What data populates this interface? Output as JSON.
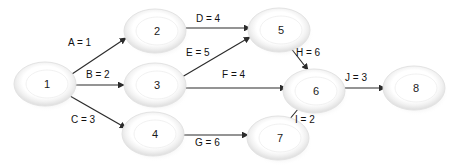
{
  "diagram": {
    "type": "directed-network",
    "background_color": "#ffffff",
    "node_fill_color": "#ffffff",
    "node_ring_color": "#e6e6e6",
    "node_shadow_color": "#cfcfcf",
    "edge_color": "#2b2b2b",
    "label_color": "#111111",
    "nodes": [
      {
        "id": "1",
        "label": "1",
        "cx": 45,
        "cy": 84,
        "rx": 31,
        "ry": 22
      },
      {
        "id": "2",
        "label": "2",
        "cx": 155,
        "cy": 31,
        "rx": 31,
        "ry": 22
      },
      {
        "id": "3",
        "label": "3",
        "cx": 155,
        "cy": 85,
        "rx": 31,
        "ry": 22
      },
      {
        "id": "4",
        "label": "4",
        "cx": 153,
        "cy": 134,
        "rx": 31,
        "ry": 22
      },
      {
        "id": "5",
        "label": "5",
        "cx": 279,
        "cy": 30,
        "rx": 31,
        "ry": 22
      },
      {
        "id": "6",
        "label": "6",
        "cx": 314,
        "cy": 91,
        "rx": 31,
        "ry": 22
      },
      {
        "id": "7",
        "label": "7",
        "cx": 278,
        "cy": 138,
        "rx": 31,
        "ry": 22
      },
      {
        "id": "8",
        "label": "8",
        "cx": 414,
        "cy": 88,
        "rx": 31,
        "ry": 22
      }
    ],
    "edges": [
      {
        "id": "A",
        "name": "A",
        "weight": 1,
        "label": "A = 1",
        "from": "1",
        "to": "2",
        "x1": 72,
        "y1": 74,
        "x2": 126,
        "y2": 38,
        "lx": 68,
        "ly": 43
      },
      {
        "id": "B",
        "name": "B",
        "weight": 2,
        "label": "B = 2",
        "from": "1",
        "to": "3",
        "x1": 74,
        "y1": 85,
        "x2": 124,
        "y2": 85,
        "lx": 86,
        "ly": 75
      },
      {
        "id": "C",
        "name": "C",
        "weight": 3,
        "label": "C = 3",
        "from": "1",
        "to": "4",
        "x1": 70,
        "y1": 96,
        "x2": 126,
        "y2": 128,
        "lx": 71,
        "ly": 120
      },
      {
        "id": "D",
        "name": "D",
        "weight": 4,
        "label": "D = 4",
        "from": "2",
        "to": "5",
        "x1": 184,
        "y1": 28,
        "x2": 250,
        "y2": 28,
        "lx": 196,
        "ly": 19
      },
      {
        "id": "E",
        "name": "E",
        "weight": 5,
        "label": "E = 5",
        "from": "3",
        "to": "5",
        "x1": 182,
        "y1": 77,
        "x2": 250,
        "y2": 37,
        "lx": 186,
        "ly": 53
      },
      {
        "id": "F",
        "name": "F",
        "weight": 4,
        "label": "F = 4",
        "from": "3",
        "to": "6",
        "x1": 184,
        "y1": 88,
        "x2": 286,
        "y2": 88,
        "lx": 222,
        "ly": 75
      },
      {
        "id": "G",
        "name": "G",
        "weight": 6,
        "label": "G = 6",
        "from": "4",
        "to": "7",
        "x1": 182,
        "y1": 135,
        "x2": 248,
        "y2": 135,
        "lx": 195,
        "ly": 143
      },
      {
        "id": "H",
        "name": "H",
        "weight": 6,
        "label": "H = 6",
        "from": "5",
        "to": "6",
        "x1": 290,
        "y1": 47,
        "x2": 308,
        "y2": 70,
        "lx": 296,
        "ly": 53
      },
      {
        "id": "I",
        "name": "I",
        "weight": 2,
        "label": "I = 2",
        "from": "7",
        "to": "6",
        "x1": 289,
        "y1": 120,
        "x2": 303,
        "y2": 103,
        "lx": 295,
        "ly": 120
      },
      {
        "id": "J",
        "name": "J",
        "weight": 3,
        "label": "J = 3",
        "from": "6",
        "to": "8",
        "x1": 343,
        "y1": 88,
        "x2": 385,
        "y2": 88,
        "lx": 345,
        "ly": 78
      }
    ],
    "caption_sliver": ""
  }
}
